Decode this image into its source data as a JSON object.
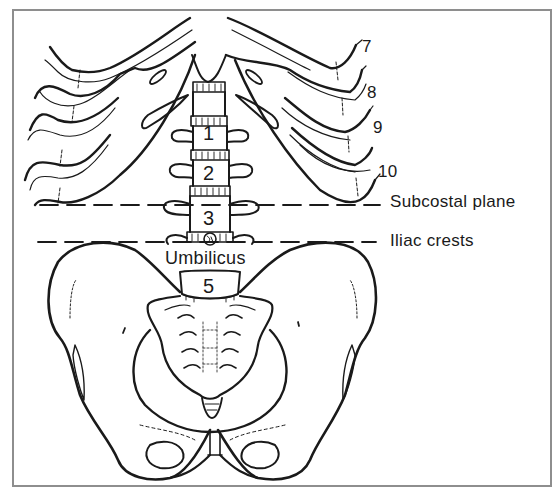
{
  "figure": {
    "type": "anatomical-diagram",
    "colors": {
      "line": "#1a1a1a",
      "frame": "#8e8e8e",
      "background": "#ffffff"
    }
  },
  "rib_labels": [
    "7",
    "8",
    "9",
    "10"
  ],
  "vertebra_labels": [
    "1",
    "2",
    "3",
    "5"
  ],
  "plane_labels": {
    "subcostal": "Subcostal plane",
    "iliac": "Iliac crests"
  },
  "landmarks": {
    "umbilicus": "Umbilicus"
  }
}
